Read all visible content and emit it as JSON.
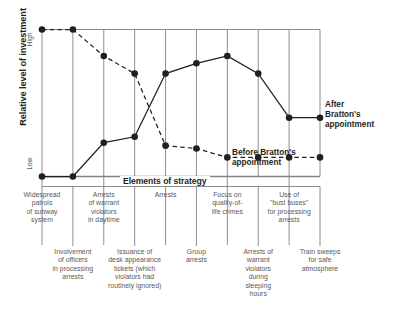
{
  "axes": {
    "y_title": "Relative level of investment",
    "y_high": "High",
    "y_low": "Low",
    "x_title": "Elements of strategy"
  },
  "annotations": {
    "before_line1": "Before Bratton's",
    "before_line2": "appointment",
    "after_line1": "After",
    "after_line2": "Bratton's",
    "after_line3": "appointment"
  },
  "chart_data": {
    "type": "line",
    "title": "Elements of strategy",
    "xlabel": "Elements of strategy",
    "ylabel": "Relative level of investment",
    "ylim": [
      0,
      100
    ],
    "ytick_labels": [
      "Low",
      "High"
    ],
    "grid": true,
    "legend_position": "inline-annotation",
    "categories": [
      "Widespread patrols of subway system",
      "Involvement of officers in processing arrests",
      "Arrests of warrant violators in daytime",
      "Issuance of desk appearance tickets (which violators had routinely ignored)",
      "Arrests",
      "Group arrests",
      "Focus on quality-of-life crimes",
      "Arrests of warrant violators during sleeping hours",
      "Use of \"bust buses\" for processing arrests",
      "Train sweeps for safe atmosphere"
    ],
    "series": [
      {
        "name": "Before Bratton's appointment",
        "style": "dashed",
        "values": [
          100,
          100,
          82,
          70,
          21,
          19,
          13,
          13,
          13,
          13
        ]
      },
      {
        "name": "After Bratton's appointment",
        "style": "solid",
        "values": [
          0,
          0,
          23,
          27,
          70,
          77,
          82,
          70,
          40,
          40
        ]
      }
    ]
  },
  "ticks_upper": [
    {
      "index": 0,
      "lines": [
        "Widespread",
        "patrols",
        "of subway",
        "system"
      ]
    },
    {
      "index": 2,
      "lines": [
        "Arrests",
        "of warrant",
        "violators",
        "in daytime"
      ]
    },
    {
      "index": 4,
      "lines": [
        "Arrests"
      ]
    },
    {
      "index": 6,
      "lines": [
        "Focus on",
        "quality-of-",
        "life crimes"
      ]
    },
    {
      "index": 8,
      "lines": [
        "Use of",
        "\"bust buses\"",
        "for processing",
        "arrests"
      ]
    }
  ],
  "ticks_lower": [
    {
      "index": 1,
      "lines": [
        "Involvement",
        "of officers",
        "in processing",
        "arrests"
      ]
    },
    {
      "index": 3,
      "lines": [
        "Issuance of",
        "desk appearance",
        "tickets (which",
        "violators had",
        "routinely ignored)"
      ]
    },
    {
      "index": 5,
      "lines": [
        "Group",
        "arrests"
      ]
    },
    {
      "index": 7,
      "lines": [
        "Arrests of",
        "warrant",
        "violators",
        "during",
        "sleeping",
        "hours"
      ]
    },
    {
      "index": 9,
      "lines": [
        "Train sweeps",
        "for safe",
        "atmosphere"
      ]
    }
  ],
  "colors": {
    "ink": "#231f20",
    "grid": "#808285",
    "muted_text": "#58595b",
    "background": "#ffffff"
  }
}
